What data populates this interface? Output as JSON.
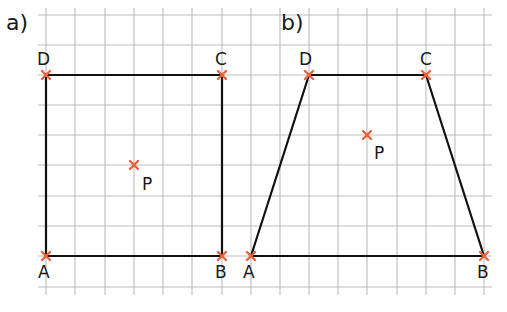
{
  "grid": {
    "x_lines": [
      46,
      75,
      105,
      134,
      163,
      192,
      222,
      251,
      280,
      309,
      338,
      367,
      397,
      426,
      455,
      484
    ],
    "y_lines": [
      15,
      45,
      75,
      105,
      135,
      165,
      196,
      226,
      256,
      287
    ],
    "x_extent": [
      38,
      492
    ],
    "y_extent": [
      8,
      295
    ],
    "color": "#b9bdc2"
  },
  "colors": {
    "line": "#111111",
    "marker": "#e8623a"
  },
  "figures": [
    {
      "label": "a)",
      "label_pos": [
        6,
        12
      ],
      "shape": "rectangle",
      "vertices": [
        {
          "name": "A",
          "x": 46,
          "y": 256,
          "lx": 38,
          "ly": 264
        },
        {
          "name": "B",
          "x": 222,
          "y": 256,
          "lx": 215,
          "ly": 264
        },
        {
          "name": "C",
          "x": 222,
          "y": 75,
          "lx": 215,
          "ly": 51
        },
        {
          "name": "D",
          "x": 46,
          "y": 75,
          "lx": 37,
          "ly": 51
        }
      ],
      "point": {
        "name": "P",
        "x": 134,
        "y": 165,
        "lx": 142,
        "ly": 176
      }
    },
    {
      "label": "b)",
      "label_pos": [
        281,
        12
      ],
      "shape": "trapezoid",
      "vertices": [
        {
          "name": "A",
          "x": 251,
          "y": 256,
          "lx": 243,
          "ly": 264
        },
        {
          "name": "B",
          "x": 484,
          "y": 256,
          "lx": 477,
          "ly": 264
        },
        {
          "name": "C",
          "x": 426,
          "y": 75,
          "lx": 420,
          "ly": 51
        },
        {
          "name": "D",
          "x": 309,
          "y": 75,
          "lx": 299,
          "ly": 51
        }
      ],
      "point": {
        "name": "P",
        "x": 367,
        "y": 135,
        "lx": 374,
        "ly": 145
      }
    }
  ]
}
